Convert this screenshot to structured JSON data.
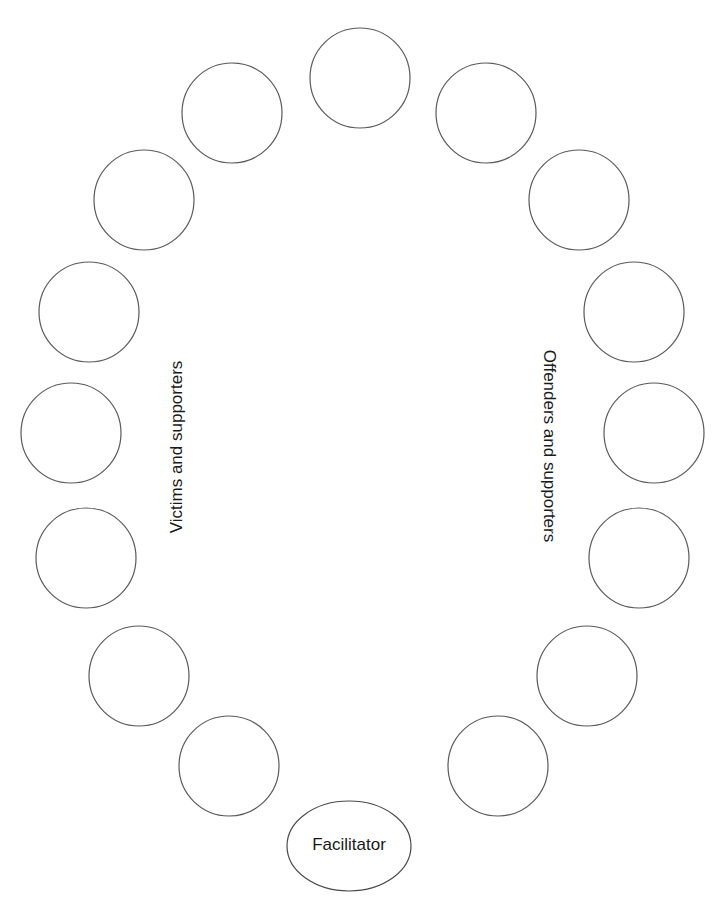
{
  "diagram": {
    "title": "",
    "stroke_color": "#5a5a5a",
    "text_color": "#1a1a1a",
    "seat_radius": 50,
    "labels": {
      "left_group": "Victims and supporters",
      "right_group": "Offenders and supporters",
      "facilitator": "Facilitator"
    },
    "seats": [
      {
        "id": "top",
        "cx": 360,
        "cy": 78
      },
      {
        "id": "right-1",
        "cx": 486,
        "cy": 113
      },
      {
        "id": "right-2",
        "cx": 579,
        "cy": 200
      },
      {
        "id": "right-3",
        "cx": 634,
        "cy": 312
      },
      {
        "id": "right-4",
        "cx": 654,
        "cy": 433
      },
      {
        "id": "right-5",
        "cx": 639,
        "cy": 558
      },
      {
        "id": "right-6",
        "cx": 587,
        "cy": 676
      },
      {
        "id": "right-7",
        "cx": 498,
        "cy": 766
      },
      {
        "id": "left-1",
        "cx": 232,
        "cy": 113
      },
      {
        "id": "left-2",
        "cx": 144,
        "cy": 200
      },
      {
        "id": "left-3",
        "cx": 89,
        "cy": 312
      },
      {
        "id": "left-4",
        "cx": 71,
        "cy": 433
      },
      {
        "id": "left-5",
        "cx": 86,
        "cy": 558
      },
      {
        "id": "left-6",
        "cx": 139,
        "cy": 676
      },
      {
        "id": "left-7",
        "cx": 229,
        "cy": 766
      }
    ],
    "facilitator_ellipse": {
      "cx": 349,
      "cy": 846,
      "rx": 62,
      "ry": 45
    }
  }
}
